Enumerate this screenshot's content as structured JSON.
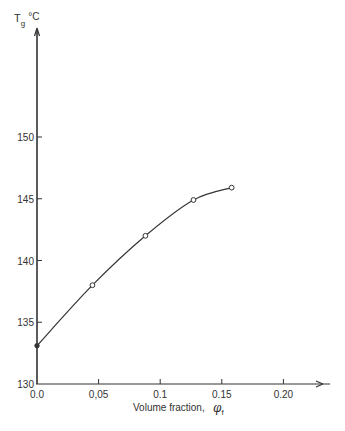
{
  "chart_data": {
    "type": "line",
    "title": "",
    "xlabel": "Volume fraction, φf",
    "ylabel": "Tg °C",
    "xlim": [
      0.0,
      0.235
    ],
    "ylim": [
      130,
      157
    ],
    "grid": false,
    "legend": null,
    "x_ticks": [
      "0.0",
      "0,05",
      "0.1",
      "0.15",
      "0.20"
    ],
    "x_tick_values": [
      0.0,
      0.05,
      0.1,
      0.15,
      0.2
    ],
    "y_ticks": [
      "130",
      "135",
      "140",
      "145",
      "150"
    ],
    "y_tick_values": [
      130,
      135,
      140,
      145,
      150
    ],
    "series": [
      {
        "name": "Tg",
        "marker": "open-circle",
        "x": [
          0.0,
          0.045,
          0.088,
          0.127,
          0.158
        ],
        "y": [
          133.1,
          138.0,
          142.0,
          144.9,
          145.9
        ]
      }
    ]
  },
  "labels": {
    "y_axis_main": "T",
    "y_axis_sub": "g",
    "y_axis_unit": "°C",
    "x_axis_text": "Volume fraction,",
    "x_axis_symbol": "φ",
    "x_axis_symbol_sub": "f"
  },
  "colors": {
    "ink": "#333333",
    "background": "#ffffff"
  }
}
